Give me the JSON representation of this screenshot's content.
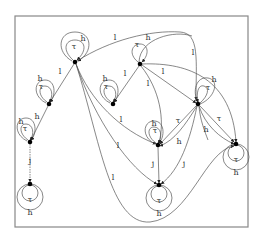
{
  "diagram": {
    "type": "state-transition-graph",
    "frame": {
      "x": 15,
      "y": 16,
      "w": 233,
      "h": 211,
      "color": "#888888"
    },
    "nodes": [
      {
        "id": "n1",
        "x": 75,
        "y": 62
      },
      {
        "id": "n2",
        "x": 140,
        "y": 64
      },
      {
        "id": "n3",
        "x": 49,
        "y": 104
      },
      {
        "id": "n4",
        "x": 113,
        "y": 104
      },
      {
        "id": "n5",
        "x": 198,
        "y": 104
      },
      {
        "id": "n6",
        "x": 30,
        "y": 142
      },
      {
        "id": "n7",
        "x": 158,
        "y": 145
      },
      {
        "id": "n8",
        "x": 236,
        "y": 144
      },
      {
        "id": "n9",
        "x": 30,
        "y": 184
      },
      {
        "id": "n10",
        "x": 159,
        "y": 185
      }
    ],
    "labels": {
      "h": "h",
      "tau": "τ",
      "l": "l",
      "j": "j"
    },
    "edge_labels": [
      {
        "text": "h",
        "x": 83,
        "y": 41
      },
      {
        "text": "τ",
        "x": 74,
        "y": 49
      },
      {
        "text": "l",
        "x": 115,
        "y": 40
      },
      {
        "text": "h",
        "x": 148,
        "y": 40
      },
      {
        "text": "τ",
        "x": 137,
        "y": 47
      },
      {
        "text": "l",
        "x": 193,
        "y": 55
      },
      {
        "text": "l",
        "x": 163,
        "y": 74
      },
      {
        "text": "l",
        "x": 60,
        "y": 74
      },
      {
        "text": "l",
        "x": 125,
        "y": 76
      },
      {
        "text": "l",
        "x": 148,
        "y": 86
      },
      {
        "text": "h",
        "x": 40,
        "y": 81
      },
      {
        "text": "τ",
        "x": 41,
        "y": 89
      },
      {
        "text": "h",
        "x": 105,
        "y": 81
      },
      {
        "text": "τ",
        "x": 106,
        "y": 89
      },
      {
        "text": "h",
        "x": 214,
        "y": 82
      },
      {
        "text": "τ",
        "x": 208,
        "y": 90
      },
      {
        "text": "h",
        "x": 21,
        "y": 124
      },
      {
        "text": "h",
        "x": 37,
        "y": 119
      },
      {
        "text": "τ",
        "x": 25,
        "y": 131
      },
      {
        "text": "l",
        "x": 121,
        "y": 122
      },
      {
        "text": "h",
        "x": 154,
        "y": 126
      },
      {
        "text": "τ",
        "x": 155,
        "y": 133
      },
      {
        "text": "τ",
        "x": 178,
        "y": 123
      },
      {
        "text": "τ",
        "x": 219,
        "y": 121
      },
      {
        "text": "h",
        "x": 206,
        "y": 132
      },
      {
        "text": "h",
        "x": 179,
        "y": 144
      },
      {
        "text": "l",
        "x": 118,
        "y": 148
      },
      {
        "text": "j",
        "x": 30,
        "y": 163
      },
      {
        "text": "j",
        "x": 153,
        "y": 166
      },
      {
        "text": "j",
        "x": 184,
        "y": 166
      },
      {
        "text": "l",
        "x": 113,
        "y": 180
      },
      {
        "text": "τ",
        "x": 30,
        "y": 202
      },
      {
        "text": "h",
        "x": 30,
        "y": 215
      },
      {
        "text": "τ",
        "x": 159,
        "y": 203
      },
      {
        "text": "h",
        "x": 159,
        "y": 216
      },
      {
        "text": "τ",
        "x": 236,
        "y": 162
      },
      {
        "text": "h",
        "x": 236,
        "y": 175
      }
    ]
  }
}
